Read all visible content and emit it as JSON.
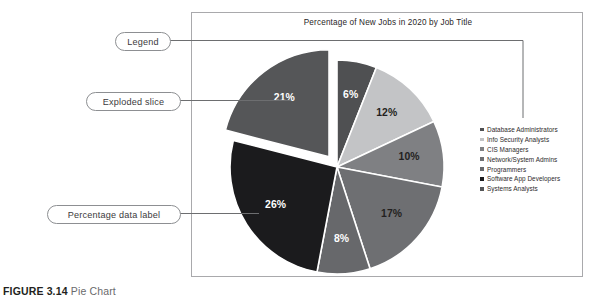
{
  "figure": {
    "number": "FIGURE 3.14",
    "title": "Pie Chart"
  },
  "callouts": {
    "legend": "Legend",
    "exploded": "Exploded slice",
    "data_label": "Percentage data label"
  },
  "colors": {
    "panel_border": "#a9a9ac",
    "slice_6": "#4f5052",
    "slice_12": "#c3c4c6",
    "slice_10": "#7f8083",
    "slice_17": "#6e6f72",
    "slice_8": "#67686b",
    "slice_26": "#1b1b1d",
    "slice_21": "#555658",
    "slice_divider": "#ffffff"
  },
  "chart_data": {
    "type": "pie",
    "title": "Percentage of New Jobs in 2020 by Job Title",
    "xlabel": "",
    "ylabel": "",
    "grid": false,
    "legend_position": "right",
    "exploded_slice": "Systems Analysts",
    "labels": [
      "Database Administrators",
      "Info Security Analysts",
      "CIS Managers",
      "Network/System Admins",
      "Programmers",
      "Software App Developers",
      "Systems Analysts"
    ],
    "values": [
      6,
      12,
      10,
      17,
      8,
      26,
      21
    ],
    "value_labels": [
      "6%",
      "12%",
      "10%",
      "17%",
      "8%",
      "26%",
      "21%"
    ],
    "slice_colors": [
      "#4f5052",
      "#c3c4c6",
      "#7f8083",
      "#6e6f72",
      "#67686b",
      "#1b1b1d",
      "#555658"
    ],
    "label_text_colors": [
      "#ffffff",
      "#231f20",
      "#231f20",
      "#231f20",
      "#ffffff",
      "#ffffff",
      "#ffffff"
    ]
  },
  "legend": {
    "items": [
      {
        "label": "Database Administrators",
        "color": "#4f5052"
      },
      {
        "label": "Info Security Analysts",
        "color": "#c3c4c6"
      },
      {
        "label": "CIS Managers",
        "color": "#7f8083"
      },
      {
        "label": "Network/System Admins",
        "color": "#6e6f72"
      },
      {
        "label": "Programmers",
        "color": "#67686b"
      },
      {
        "label": "Software App Developers",
        "color": "#1b1b1d"
      },
      {
        "label": "Systems Analysts",
        "color": "#555658"
      }
    ]
  }
}
